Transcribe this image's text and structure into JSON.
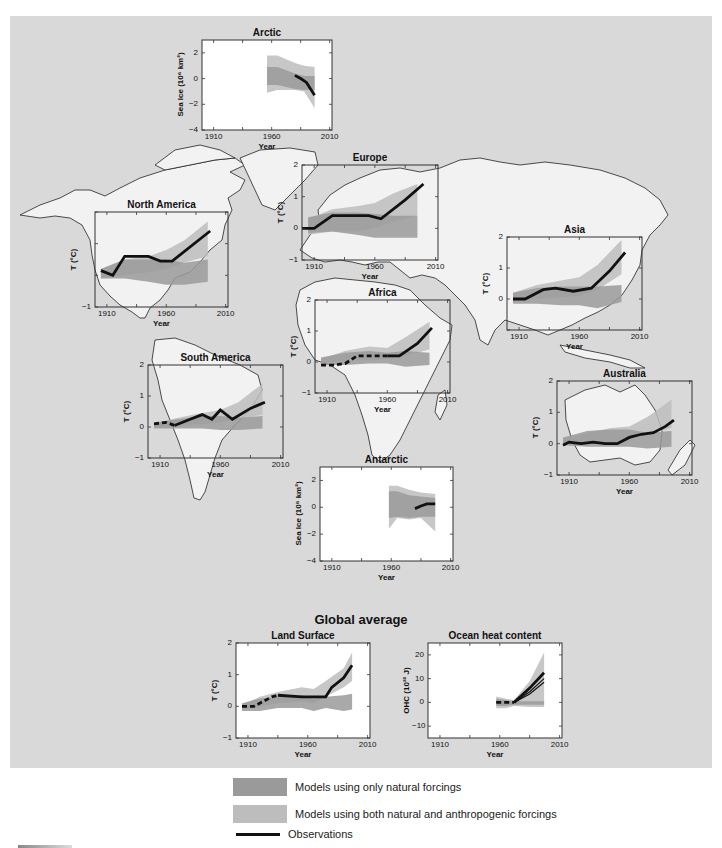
{
  "colors": {
    "panel_bg": "#d9d9d9",
    "land": "#f2f2f2",
    "land_stroke": "#222222",
    "natural_band": "#9a9a9a",
    "anthropogenic_band": "#bdbdbd",
    "observations": "#111111"
  },
  "global_title": "Global average",
  "legend": {
    "natural": "Models using only natural forcings",
    "both": "Models using both natural and anthropogenic forcings",
    "observations": "Observations"
  },
  "chart_data": [
    {
      "id": "arctic",
      "type": "area",
      "title": "Arctic",
      "xlabel": "Year",
      "ylabel": "Sea Ice (10⁶ km²)",
      "xlim": [
        1900,
        2012
      ],
      "ylim": [
        -4,
        3
      ],
      "xticks": [
        1910,
        1960,
        2010
      ],
      "yticks": [
        2,
        0,
        -2,
        -4
      ],
      "box": {
        "x": 202,
        "y": 40,
        "w": 130,
        "h": 90
      },
      "natural_band": {
        "x": [
          1956,
          1965,
          1980,
          1988,
          1997
        ],
        "upper": [
          0.9,
          0.9,
          0.4,
          0.2,
          0.2
        ],
        "lower": [
          -0.5,
          -0.5,
          -0.8,
          -0.9,
          -0.9
        ]
      },
      "both_band": {
        "x": [
          1956,
          1965,
          1980,
          1988,
          1997
        ],
        "upper": [
          1.8,
          1.8,
          1.2,
          1.0,
          0.9
        ],
        "lower": [
          -1.1,
          -0.9,
          -0.9,
          -1.0,
          -2.3
        ]
      },
      "observations": {
        "x": [
          1980,
          1985,
          1990,
          1997
        ],
        "y": [
          0.25,
          0.0,
          -0.3,
          -1.3
        ],
        "dashed_until": null
      }
    },
    {
      "id": "europe",
      "type": "area",
      "title": "Europe",
      "xlabel": "Year",
      "ylabel": "T (°C)",
      "xlim": [
        1900,
        2012
      ],
      "ylim": [
        -1,
        2
      ],
      "xticks": [
        1910,
        1960,
        2010
      ],
      "yticks": [
        2,
        1,
        0,
        -1
      ],
      "box": {
        "x": 302,
        "y": 165,
        "w": 136,
        "h": 95
      },
      "natural_band": {
        "x": [
          1905,
          1925,
          1945,
          1960,
          1975,
          1995
        ],
        "upper": [
          0.35,
          0.5,
          0.5,
          0.45,
          0.4,
          0.4
        ],
        "lower": [
          -0.15,
          -0.1,
          -0.2,
          -0.3,
          -0.3,
          -0.3
        ]
      },
      "both_band": {
        "x": [
          1905,
          1925,
          1945,
          1960,
          1975,
          1995
        ],
        "upper": [
          0.3,
          0.6,
          0.7,
          0.8,
          1.1,
          1.4
        ],
        "lower": [
          -0.2,
          -0.1,
          -0.1,
          0.0,
          0.2,
          0.4
        ]
      },
      "observations": {
        "x": [
          1900,
          1910,
          1925,
          1955,
          1965,
          1985,
          2000
        ],
        "y": [
          0.0,
          0.0,
          0.4,
          0.4,
          0.3,
          0.9,
          1.4
        ],
        "dashed_until": null
      }
    },
    {
      "id": "north_america",
      "type": "area",
      "title": "North America",
      "xlabel": "Year",
      "ylabel": "T (°C)",
      "xlim": [
        1900,
        2012
      ],
      "ylim": [
        -1,
        2
      ],
      "xticks": [
        1910,
        1960,
        2010
      ],
      "yticks": [
        -1
      ],
      "box": {
        "x": 95,
        "y": 212,
        "w": 133,
        "h": 95
      },
      "natural_band": {
        "x": [
          1905,
          1925,
          1945,
          1960,
          1975,
          1995
        ],
        "upper": [
          0.2,
          0.5,
          0.5,
          0.5,
          0.4,
          0.5
        ],
        "lower": [
          -0.1,
          -0.1,
          -0.2,
          -0.3,
          -0.3,
          -0.2
        ]
      },
      "both_band": {
        "x": [
          1905,
          1925,
          1945,
          1960,
          1975,
          1995
        ],
        "upper": [
          0.2,
          0.5,
          0.6,
          0.8,
          1.1,
          1.7
        ],
        "lower": [
          -0.1,
          0.0,
          0.1,
          0.2,
          0.4,
          0.6
        ]
      },
      "observations": {
        "x": [
          1905,
          1915,
          1925,
          1945,
          1955,
          1965,
          1997
        ],
        "y": [
          0.15,
          0.0,
          0.6,
          0.6,
          0.45,
          0.45,
          1.4
        ],
        "dashed_until": null
      }
    },
    {
      "id": "asia",
      "type": "area",
      "title": "Asia",
      "xlabel": "Year",
      "ylabel": "T (°C)",
      "xlim": [
        1900,
        2012
      ],
      "ylim": [
        -1,
        2
      ],
      "xticks": [
        1910,
        1960,
        2010
      ],
      "yticks": [
        2,
        1,
        0
      ],
      "box": {
        "x": 507,
        "y": 237,
        "w": 135,
        "h": 93
      },
      "natural_band": {
        "x": [
          1905,
          1925,
          1945,
          1960,
          1975,
          1995
        ],
        "upper": [
          0.2,
          0.35,
          0.4,
          0.4,
          0.4,
          0.45
        ],
        "lower": [
          -0.15,
          -0.15,
          -0.2,
          -0.2,
          -0.3,
          -0.1
        ]
      },
      "both_band": {
        "x": [
          1905,
          1925,
          1945,
          1960,
          1975,
          1995
        ],
        "upper": [
          0.2,
          0.45,
          0.6,
          0.7,
          1.1,
          1.9
        ],
        "lower": [
          -0.1,
          0.0,
          0.05,
          0.1,
          0.3,
          0.8
        ]
      },
      "observations": {
        "x": [
          1905,
          1915,
          1930,
          1940,
          1955,
          1970,
          1985,
          1998
        ],
        "y": [
          0.0,
          0.0,
          0.3,
          0.35,
          0.25,
          0.35,
          0.9,
          1.5
        ],
        "dashed_until": null
      }
    },
    {
      "id": "africa",
      "type": "area",
      "title": "Africa",
      "xlabel": "Year",
      "ylabel": "T (°C)",
      "xlim": [
        1900,
        2012
      ],
      "ylim": [
        -1,
        2
      ],
      "xticks": [
        1910,
        1960,
        2010
      ],
      "yticks": [
        2,
        1,
        0,
        -1
      ],
      "box": {
        "x": 315,
        "y": 300,
        "w": 135,
        "h": 93
      },
      "natural_band": {
        "x": [
          1905,
          1925,
          1945,
          1960,
          1975,
          1995
        ],
        "upper": [
          0.15,
          0.3,
          0.35,
          0.3,
          0.35,
          0.3
        ],
        "lower": [
          -0.1,
          -0.1,
          -0.05,
          -0.05,
          -0.15,
          -0.1
        ]
      },
      "both_band": {
        "x": [
          1905,
          1925,
          1945,
          1960,
          1975,
          1995
        ],
        "upper": [
          0.1,
          0.35,
          0.5,
          0.45,
          0.8,
          1.3
        ],
        "lower": [
          -0.05,
          0.05,
          0.05,
          0.1,
          0.2,
          0.4
        ]
      },
      "observations": {
        "x": [
          1905,
          1915,
          1925,
          1935,
          1945,
          1960,
          1970,
          1985,
          1997
        ],
        "y": [
          -0.1,
          -0.1,
          -0.05,
          0.2,
          0.2,
          0.2,
          0.2,
          0.6,
          1.1
        ],
        "dashed_until": 1948
      }
    },
    {
      "id": "south_america",
      "type": "area",
      "title": "South America",
      "xlabel": "Year",
      "ylabel": "T (°C)",
      "xlim": [
        1900,
        2012
      ],
      "ylim": [
        -1,
        2
      ],
      "xticks": [
        1910,
        1960,
        2010
      ],
      "yticks": [
        2,
        1,
        0,
        -1
      ],
      "box": {
        "x": 148,
        "y": 365,
        "w": 135,
        "h": 93
      },
      "natural_band": {
        "x": [
          1905,
          1925,
          1945,
          1960,
          1975,
          1995
        ],
        "upper": [
          0.15,
          0.25,
          0.35,
          0.35,
          0.3,
          0.35
        ],
        "lower": [
          -0.05,
          -0.05,
          -0.05,
          -0.1,
          -0.1,
          -0.05
        ]
      },
      "both_band": {
        "x": [
          1905,
          1925,
          1945,
          1960,
          1975,
          1995
        ],
        "upper": [
          0.1,
          0.3,
          0.45,
          0.55,
          0.8,
          1.4
        ],
        "lower": [
          0.0,
          0.05,
          0.1,
          0.15,
          0.25,
          0.4
        ]
      },
      "observations": {
        "x": [
          1905,
          1915,
          1922,
          1935,
          1945,
          1953,
          1960,
          1970,
          1985,
          1997
        ],
        "y": [
          0.1,
          0.15,
          0.05,
          0.25,
          0.4,
          0.25,
          0.55,
          0.25,
          0.6,
          0.8
        ],
        "dashed_until": 1920
      }
    },
    {
      "id": "australia",
      "type": "area",
      "title": "Australia",
      "xlabel": "Year",
      "ylabel": "T (°C)",
      "xlim": [
        1900,
        2012
      ],
      "ylim": [
        -1,
        2
      ],
      "xticks": [
        1910,
        1960,
        2010
      ],
      "yticks": [
        2,
        1,
        0,
        -1
      ],
      "box": {
        "x": 557,
        "y": 381,
        "w": 135,
        "h": 94
      },
      "natural_band": {
        "x": [
          1905,
          1925,
          1945,
          1960,
          1975,
          1995
        ],
        "upper": [
          0.2,
          0.4,
          0.45,
          0.45,
          0.35,
          0.4
        ],
        "lower": [
          -0.05,
          -0.1,
          -0.1,
          -0.1,
          -0.15,
          -0.1
        ]
      },
      "both_band": {
        "x": [
          1905,
          1925,
          1945,
          1960,
          1975,
          1995
        ],
        "upper": [
          0.15,
          0.35,
          0.5,
          0.55,
          0.85,
          1.4
        ],
        "lower": [
          -0.05,
          0.0,
          0.05,
          0.15,
          0.3,
          0.5
        ]
      },
      "observations": {
        "x": [
          1905,
          1910,
          1920,
          1930,
          1940,
          1950,
          1960,
          1970,
          1980,
          1990,
          1997
        ],
        "y": [
          -0.05,
          0.05,
          0.0,
          0.05,
          0.0,
          0.0,
          0.2,
          0.3,
          0.35,
          0.55,
          0.75
        ],
        "dashed_until": null
      }
    },
    {
      "id": "antarctic",
      "type": "area",
      "title": "Antarctic",
      "xlabel": "Year",
      "ylabel": "Sea Ice (10⁶ km²)",
      "xlim": [
        1900,
        2012
      ],
      "ylim": [
        -4,
        3
      ],
      "xticks": [
        1910,
        1960,
        2010
      ],
      "yticks": [
        2,
        0,
        -2,
        -4
      ],
      "box": {
        "x": 320,
        "y": 467,
        "w": 133,
        "h": 94
      },
      "natural_band": {
        "x": [
          1958,
          1965,
          1975,
          1985,
          1997
        ],
        "upper": [
          1.2,
          1.2,
          0.9,
          0.8,
          0.7
        ],
        "lower": [
          -0.8,
          -0.7,
          -0.8,
          -0.7,
          -0.7
        ]
      },
      "both_band": {
        "x": [
          1958,
          1965,
          1975,
          1985,
          1997
        ],
        "upper": [
          1.6,
          1.6,
          1.3,
          1.1,
          1.0
        ],
        "lower": [
          -1.6,
          -0.8,
          -0.9,
          -0.8,
          -1.8
        ]
      },
      "observations": {
        "x": [
          1980,
          1985,
          1990,
          1997
        ],
        "y": [
          -0.1,
          0.1,
          0.25,
          0.25
        ],
        "dashed_until": null
      }
    },
    {
      "id": "land_surface",
      "type": "area",
      "title": "Land Surface",
      "xlabel": "Year",
      "ylabel": "T (°C)",
      "xlim": [
        1900,
        2012
      ],
      "ylim": [
        -1,
        2
      ],
      "xticks": [
        1910,
        1960,
        2010
      ],
      "yticks": [
        2,
        1,
        0,
        -1
      ],
      "box": {
        "x": 236,
        "y": 643,
        "w": 134,
        "h": 95
      },
      "natural_band": {
        "x": [
          1905,
          1920,
          1935,
          1955,
          1965,
          1975,
          1990,
          1997
        ],
        "upper": [
          0.1,
          0.25,
          0.3,
          0.35,
          0.25,
          0.3,
          0.35,
          0.4
        ],
        "lower": [
          -0.15,
          -0.15,
          -0.05,
          -0.05,
          -0.15,
          -0.05,
          -0.15,
          -0.1
        ]
      },
      "both_band": {
        "x": [
          1905,
          1920,
          1935,
          1955,
          1965,
          1975,
          1990,
          1997
        ],
        "upper": [
          0.05,
          0.3,
          0.45,
          0.6,
          0.55,
          0.8,
          1.2,
          1.7
        ],
        "lower": [
          -0.1,
          0.0,
          0.1,
          0.15,
          0.1,
          0.3,
          0.6,
          0.8
        ]
      },
      "observations": {
        "x": [
          1905,
          1915,
          1930,
          1935,
          1955,
          1975,
          1980,
          1990,
          1997
        ],
        "y": [
          0.0,
          0.0,
          0.3,
          0.35,
          0.3,
          0.3,
          0.6,
          0.9,
          1.3
        ],
        "dashed_until": 1932
      }
    },
    {
      "id": "ocean_heat_content",
      "type": "area",
      "title": "Ocean heat content",
      "xlabel": "Year",
      "ylabel": "OHC (10²² J)",
      "xlim": [
        1900,
        2012
      ],
      "ylim": [
        -15,
        25
      ],
      "xticks": [
        1910,
        1960,
        2010
      ],
      "yticks": [
        20,
        10,
        0,
        -10
      ],
      "box": {
        "x": 428,
        "y": 643,
        "w": 134,
        "h": 95
      },
      "natural_band": {
        "x": [
          1957,
          1965,
          1972,
          1985,
          1997
        ],
        "upper": [
          1.5,
          1.0,
          0.5,
          0.5,
          0.5
        ],
        "lower": [
          -1.5,
          -1.5,
          -1.0,
          -1.0,
          -1.0
        ]
      },
      "both_band": {
        "x": [
          1957,
          1965,
          1972,
          1985,
          1997
        ],
        "upper": [
          2.5,
          1.5,
          1.0,
          9.0,
          21.0
        ],
        "lower": [
          -2.5,
          -2.5,
          -1.5,
          -2.0,
          -2.0
        ]
      },
      "observations": {
        "x": [
          1957,
          1965,
          1972,
          1985,
          1997
        ],
        "y": [
          0.0,
          0.0,
          0.0,
          6.0,
          12.5
        ],
        "dashed_until": 1972
      },
      "extra_observations": [
        {
          "x": [
            1972,
            1985,
            1997
          ],
          "y": [
            0.0,
            4.5,
            10.0
          ]
        },
        {
          "x": [
            1972,
            1985,
            1997
          ],
          "y": [
            0.0,
            3.5,
            8.5
          ]
        }
      ]
    }
  ]
}
